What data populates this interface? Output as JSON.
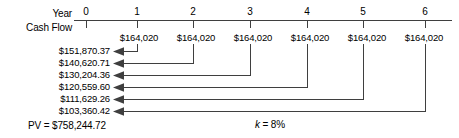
{
  "diagram": {
    "row_labels": {
      "year": "Year",
      "cash_flow": "Cash Flow"
    },
    "axis": {
      "tick_labels": [
        "0",
        "1",
        "2",
        "3",
        "4",
        "5",
        "6"
      ],
      "tick_x": [
        86,
        137,
        193,
        250,
        307,
        363,
        425
      ],
      "axis_y": 20,
      "axis_x_start": 74,
      "axis_x_end": 452
    },
    "cash_flows": [
      {
        "year": "1",
        "amount": "$164,020",
        "x": 137
      },
      {
        "year": "2",
        "amount": "$164,020",
        "x": 193
      },
      {
        "year": "3",
        "amount": "$164,020",
        "x": 250
      },
      {
        "year": "4",
        "amount": "$164,020",
        "x": 307
      },
      {
        "year": "5",
        "amount": "$164,020",
        "x": 363
      },
      {
        "year": "6",
        "amount": "$164,020",
        "x": 425
      }
    ],
    "present_values": [
      {
        "value": "$151,870.37",
        "y": 51,
        "source_x": 137
      },
      {
        "value": "$140,620.71",
        "y": 63,
        "source_x": 193
      },
      {
        "value": "$130,204.36",
        "y": 75,
        "source_x": 250
      },
      {
        "value": "$120,559.60",
        "y": 87,
        "source_x": 307
      },
      {
        "value": "$111,629.26",
        "y": 99,
        "source_x": 363
      },
      {
        "value": "$103,360.42",
        "y": 111,
        "source_x": 425
      }
    ],
    "total": {
      "prefix": "PV = ",
      "value": "$758,244.72",
      "text": "PV = $758,244.72"
    },
    "rate": {
      "symbol": "k",
      "equals": " = ",
      "value": "8%",
      "text": "k = 8%"
    },
    "colors": {
      "line": "#3f3f3f",
      "text": "#000000",
      "background": "#ffffff"
    }
  }
}
